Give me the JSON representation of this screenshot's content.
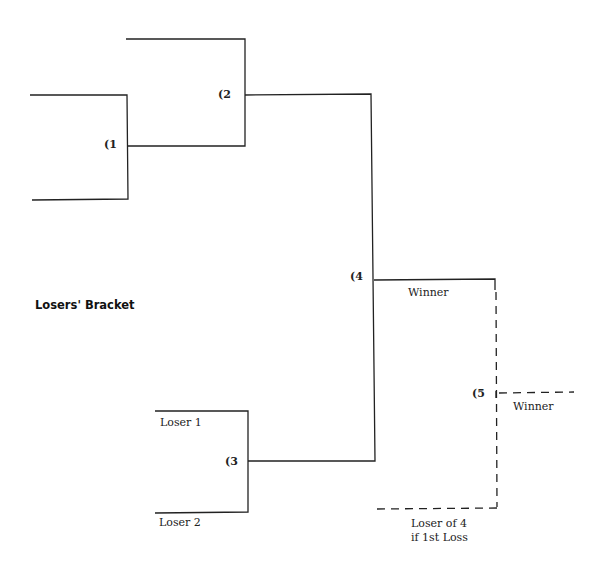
{
  "diagram": {
    "title": "Losers' Bracket",
    "games": [
      {
        "id": "1",
        "label": "(1"
      },
      {
        "id": "2",
        "label": "(2"
      },
      {
        "id": "3",
        "label": "(3"
      },
      {
        "id": "4",
        "label": "(4"
      },
      {
        "id": "5",
        "label": "(5"
      }
    ],
    "labels": {
      "loser1": "Loser 1",
      "loser2": "Loser 2",
      "winner4": "Winner",
      "winner5": "Winner",
      "loser_of_4_line1": "Loser of 4",
      "loser_of_4_line2": "if 1st Loss"
    },
    "colors": {
      "line": "#222222",
      "background": "#ffffff"
    }
  }
}
